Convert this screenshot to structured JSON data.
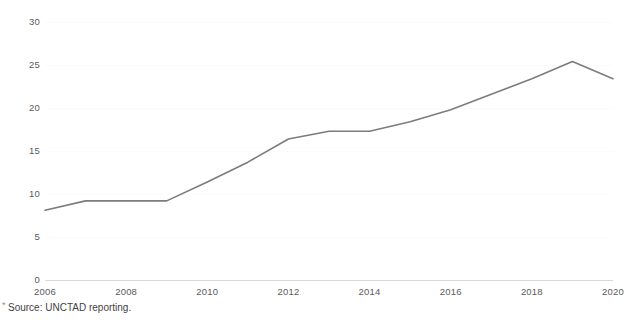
{
  "chart_data": {
    "type": "line",
    "title": "",
    "subtitle": "",
    "xlabel": "",
    "ylabel": "",
    "x": [
      2006,
      2007,
      2008,
      2009,
      2010,
      2011,
      2012,
      2013,
      2014,
      2015,
      2016,
      2017,
      2018,
      2019,
      2020
    ],
    "series": [
      {
        "name": "UNCTAD reported value",
        "values": [
          8.1,
          9.2,
          9.2,
          9.2,
          11.4,
          13.7,
          16.4,
          17.3,
          17.3,
          18.4,
          19.8,
          21.6,
          23.4,
          25.4,
          23.4
        ],
        "color": "#7c7c7c",
        "line_width": 1.6
      }
    ],
    "xlim": [
      2006,
      2020
    ],
    "ylim": [
      0,
      30
    ],
    "x_ticks": [
      2006,
      2008,
      2010,
      2012,
      2014,
      2016,
      2018,
      2020
    ],
    "x_tick_labels": [
      "2006",
      "2008",
      "2010",
      "2012",
      "2014",
      "2016",
      "2018",
      "2020"
    ],
    "y_ticks": [
      0,
      5,
      10,
      15,
      20,
      25,
      30
    ],
    "y_tick_labels": [
      "0",
      "5",
      "10",
      "15",
      "20",
      "25",
      "30"
    ],
    "grid": true,
    "grid_axis": "y",
    "grid_color": "#fbfbfb",
    "axis_color": "#d8d8d8",
    "legend": false,
    "legend_position": "none",
    "background_color": "#ffffff"
  },
  "footnote": {
    "marker": "*",
    "text": "Source: UNCTAD reporting."
  }
}
